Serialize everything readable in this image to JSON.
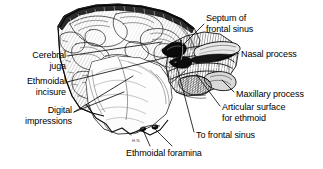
{
  "figure": {
    "kind": "anatomical-illustration",
    "background_color": "#ffffff",
    "ink_color": "#000000",
    "signature": "H.N."
  },
  "labels": [
    {
      "id": "cerebral-juga",
      "text": "Cerebral\njuga",
      "align": "right",
      "x": 6,
      "y": 50,
      "width": 60
    },
    {
      "id": "ethmoidal-incisure",
      "text": "Ethmoidal\nincisure",
      "align": "right",
      "x": 2,
      "y": 76,
      "width": 64
    },
    {
      "id": "digital-impressions",
      "text": "Digital\nimpressions",
      "align": "right",
      "x": 0,
      "y": 105,
      "width": 72
    },
    {
      "id": "septum-of-frontal-sinus",
      "text": "Septum of\nfrontal sinus",
      "align": "left",
      "x": 206,
      "y": 13,
      "width": 80
    },
    {
      "id": "nasal-process",
      "text": "Nasal process",
      "align": "left",
      "x": 241,
      "y": 49,
      "width": 80
    },
    {
      "id": "maxillary-process",
      "text": "Maxillary process",
      "align": "left",
      "x": 236,
      "y": 89,
      "width": 88
    },
    {
      "id": "articular-surface-for-ethmoid",
      "text": "Articular surface\nfor ethmoid",
      "align": "left",
      "x": 222,
      "y": 102,
      "width": 92
    },
    {
      "id": "to-frontal-sinus",
      "text": "To frontal sinus",
      "align": "left",
      "x": 196,
      "y": 130,
      "width": 84
    },
    {
      "id": "ethmoidal-foramina",
      "text": "Ethmoidal foramina",
      "align": "left",
      "x": 126,
      "y": 148,
      "width": 104
    }
  ],
  "leader_lines": [
    {
      "id": "leader-cerebral-juga",
      "from": [
        67,
        56
      ],
      "to": [
        162,
        42
      ]
    },
    {
      "id": "leader-ethmoidal-incisure",
      "from": [
        67,
        82
      ],
      "to": [
        172,
        56
      ]
    },
    {
      "id": "leader-digital-impressions-a",
      "from": [
        74,
        112
      ],
      "to": [
        124,
        92
      ]
    },
    {
      "id": "leader-digital-impressions-b",
      "from": [
        74,
        112
      ],
      "to": [
        133,
        76
      ]
    },
    {
      "id": "leader-septum",
      "from": [
        204,
        24
      ],
      "to": [
        182,
        46
      ]
    },
    {
      "id": "leader-nasal-process",
      "from": [
        239,
        53
      ],
      "to": [
        216,
        61
      ]
    },
    {
      "id": "leader-maxillary-process",
      "from": [
        234,
        92
      ],
      "to": [
        222,
        80
      ]
    },
    {
      "id": "leader-articular-surface",
      "from": [
        220,
        106
      ],
      "to": [
        196,
        74
      ]
    },
    {
      "id": "leader-to-frontal-sinus",
      "from": [
        194,
        132
      ],
      "to": [
        176,
        63
      ]
    },
    {
      "id": "leader-ethmoidal-foramina",
      "from": [
        172,
        146
      ],
      "to": [
        154,
        128
      ]
    },
    {
      "id": "leader-ethmoidal-foramina-b",
      "from": [
        150,
        146
      ],
      "to": [
        143,
        130
      ]
    }
  ]
}
